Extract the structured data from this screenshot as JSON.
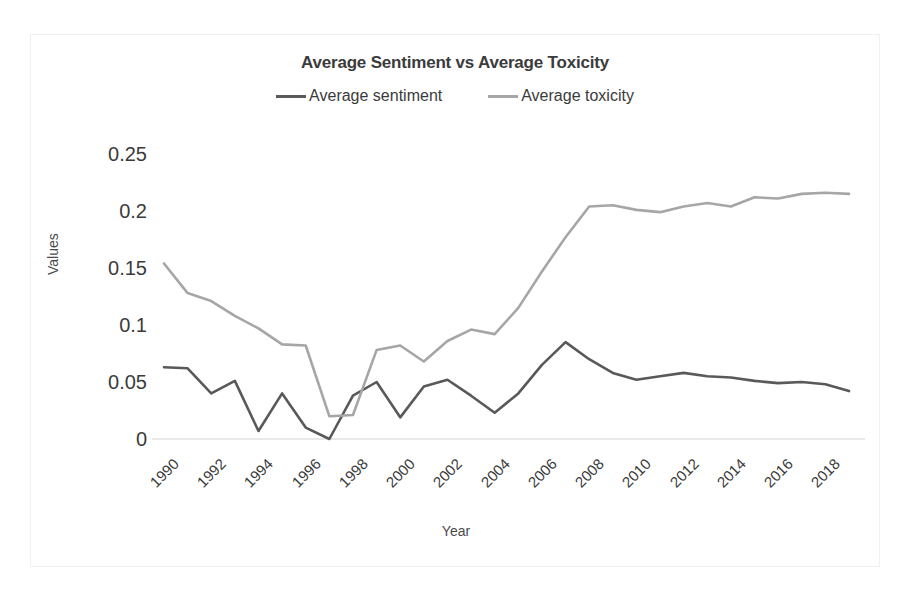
{
  "chart_data": {
    "type": "line",
    "title": "Average Sentiment vs Average Toxicity",
    "xlabel": "Year",
    "ylabel": "Values",
    "grid": false,
    "legend_position": "top-center",
    "x": [
      1990,
      1991,
      1992,
      1993,
      1994,
      1995,
      1996,
      1997,
      1998,
      1999,
      2000,
      2001,
      2002,
      2003,
      2004,
      2005,
      2006,
      2007,
      2008,
      2009,
      2010,
      2011,
      2012,
      2013,
      2014,
      2015,
      2016,
      2017,
      2018,
      2019
    ],
    "xticks": [
      "1990",
      "1992",
      "1994",
      "1996",
      "1998",
      "2000",
      "2002",
      "2004",
      "2006",
      "2008",
      "2010",
      "2012",
      "2014",
      "2016",
      "2018"
    ],
    "yticks": [
      "0",
      "0.05",
      "0.1",
      "0.15",
      "0.2",
      "0.25"
    ],
    "ytick_values": [
      0,
      0.05,
      0.1,
      0.15,
      0.2,
      0.25
    ],
    "ylim": [
      0,
      0.25
    ],
    "xlim": [
      1990,
      2019
    ],
    "series": [
      {
        "name": "Average sentiment",
        "color": "#595959",
        "values": [
          0.063,
          0.062,
          0.04,
          0.051,
          0.007,
          0.04,
          0.01,
          0.0,
          0.038,
          0.05,
          0.019,
          0.046,
          0.052,
          0.038,
          0.023,
          0.04,
          0.065,
          0.085,
          0.07,
          0.058,
          0.052,
          0.055,
          0.058,
          0.055,
          0.054,
          0.051,
          0.049,
          0.05,
          0.048,
          0.042
        ]
      },
      {
        "name": "Average toxicity",
        "color": "#a6a6a6",
        "values": [
          0.154,
          0.128,
          0.121,
          0.108,
          0.097,
          0.083,
          0.082,
          0.02,
          0.021,
          0.078,
          0.082,
          0.068,
          0.086,
          0.096,
          0.092,
          0.115,
          0.147,
          0.177,
          0.204,
          0.205,
          0.201,
          0.199,
          0.204,
          0.207,
          0.204,
          0.212,
          0.211,
          0.215,
          0.216,
          0.215
        ]
      }
    ]
  },
  "legend": [
    {
      "label": "Average sentiment",
      "color": "#595959"
    },
    {
      "label": "Average toxicity",
      "color": "#a6a6a6"
    }
  ]
}
